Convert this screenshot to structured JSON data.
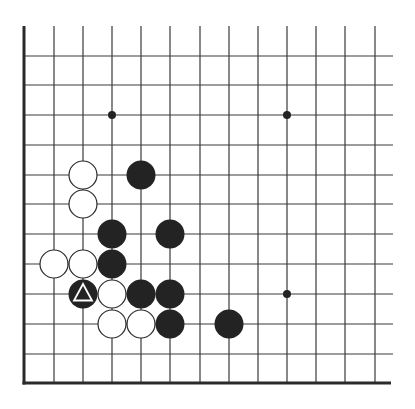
{
  "diagram": {
    "type": "go-board-corner",
    "title": "",
    "colors": {
      "background": "#ffffff",
      "grid_line": "#3a3a3a",
      "edge_line": "#2a2a2a",
      "black_stone": "#232323",
      "white_stone": "#ffffff",
      "stone_outline": "#2a2a2a",
      "marker_on_black": "#ffffff"
    },
    "grid": {
      "columns_x": [
        24,
        54,
        83,
        112,
        141,
        170,
        200,
        229,
        258,
        287,
        316,
        345,
        375
      ],
      "rows_y": [
        56,
        85,
        115,
        145,
        175,
        204,
        234,
        264,
        294,
        324,
        354,
        383
      ],
      "top_open_y": 26,
      "right_open_x": 393,
      "left_edge_col": 0,
      "bottom_edge_row": 11
    },
    "star_points": [
      {
        "col": 3,
        "row": 2
      },
      {
        "col": 9,
        "row": 2
      },
      {
        "col": 9,
        "row": 8
      }
    ],
    "stones": [
      {
        "color": "white",
        "col": 2,
        "row": 4
      },
      {
        "color": "white",
        "col": 2,
        "row": 5
      },
      {
        "color": "white",
        "col": 1,
        "row": 7
      },
      {
        "color": "white",
        "col": 2,
        "row": 7
      },
      {
        "color": "white",
        "col": 3,
        "row": 8
      },
      {
        "color": "white",
        "col": 3,
        "row": 9
      },
      {
        "color": "white",
        "col": 4,
        "row": 9
      },
      {
        "color": "black",
        "col": 4,
        "row": 4
      },
      {
        "color": "black",
        "col": 3,
        "row": 6
      },
      {
        "color": "black",
        "col": 5,
        "row": 6
      },
      {
        "color": "black",
        "col": 3,
        "row": 7
      },
      {
        "color": "black",
        "col": 2,
        "row": 8,
        "marker": "triangle"
      },
      {
        "color": "black",
        "col": 4,
        "row": 8
      },
      {
        "color": "black",
        "col": 5,
        "row": 8
      },
      {
        "color": "black",
        "col": 5,
        "row": 9
      },
      {
        "color": "black",
        "col": 7,
        "row": 9
      }
    ]
  }
}
